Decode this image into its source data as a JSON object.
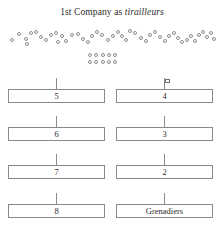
{
  "diagram": {
    "title_prefix": "1st Company as ",
    "title_emphasis": "tirailleurs",
    "background_color": "#ffffff",
    "line_color": "#8a8a8a",
    "text_color": "#2b2b2b"
  },
  "skirmish_line": {
    "name": "skirmisher-screen",
    "symbol": "open-circle",
    "count": 45,
    "circles": [
      {
        "x": 10,
        "y": 38
      },
      {
        "x": 17,
        "y": 32
      },
      {
        "x": 24,
        "y": 37
      },
      {
        "x": 29,
        "y": 31
      },
      {
        "x": 34,
        "y": 30
      },
      {
        "x": 39,
        "y": 35
      },
      {
        "x": 44,
        "y": 38
      },
      {
        "x": 49,
        "y": 33
      },
      {
        "x": 54,
        "y": 31
      },
      {
        "x": 60,
        "y": 34
      },
      {
        "x": 64,
        "y": 39
      },
      {
        "x": 70,
        "y": 33
      },
      {
        "x": 76,
        "y": 32
      },
      {
        "x": 81,
        "y": 37
      },
      {
        "x": 86,
        "y": 40
      },
      {
        "x": 90,
        "y": 34
      },
      {
        "x": 95,
        "y": 30
      },
      {
        "x": 100,
        "y": 33
      },
      {
        "x": 106,
        "y": 38
      },
      {
        "x": 111,
        "y": 34
      },
      {
        "x": 116,
        "y": 30
      },
      {
        "x": 120,
        "y": 34
      },
      {
        "x": 124,
        "y": 38
      },
      {
        "x": 128,
        "y": 29
      },
      {
        "x": 133,
        "y": 31
      },
      {
        "x": 139,
        "y": 36
      },
      {
        "x": 144,
        "y": 39
      },
      {
        "x": 148,
        "y": 33
      },
      {
        "x": 153,
        "y": 30
      },
      {
        "x": 158,
        "y": 35
      },
      {
        "x": 163,
        "y": 39
      },
      {
        "x": 167,
        "y": 34
      },
      {
        "x": 172,
        "y": 31
      },
      {
        "x": 176,
        "y": 36
      },
      {
        "x": 180,
        "y": 40
      },
      {
        "x": 185,
        "y": 38
      },
      {
        "x": 189,
        "y": 34
      },
      {
        "x": 193,
        "y": 39
      },
      {
        "x": 197,
        "y": 33
      },
      {
        "x": 201,
        "y": 30
      },
      {
        "x": 205,
        "y": 35
      },
      {
        "x": 209,
        "y": 31
      },
      {
        "x": 212,
        "y": 37
      },
      {
        "x": 56,
        "y": 40
      },
      {
        "x": 25,
        "y": 42
      }
    ]
  },
  "reserve_block": {
    "name": "skirmisher-reserve",
    "symbol": "open-circle",
    "rows": 2,
    "columns": 5,
    "count": 10,
    "circles": [
      {
        "x": 88,
        "y": 53
      },
      {
        "x": 94,
        "y": 53
      },
      {
        "x": 101,
        "y": 53
      },
      {
        "x": 107,
        "y": 53
      },
      {
        "x": 113,
        "y": 53
      },
      {
        "x": 88,
        "y": 60
      },
      {
        "x": 94,
        "y": 60
      },
      {
        "x": 101,
        "y": 60
      },
      {
        "x": 107,
        "y": 60
      },
      {
        "x": 113,
        "y": 60
      }
    ]
  },
  "formation_rows": [
    {
      "left": {
        "label": "5",
        "marker": "tick"
      },
      "right": {
        "label": "4",
        "marker": "flag"
      }
    },
    {
      "left": {
        "label": "6",
        "marker": "tick"
      },
      "right": {
        "label": "3",
        "marker": "tick"
      }
    },
    {
      "left": {
        "label": "7",
        "marker": "tick"
      },
      "right": {
        "label": "2",
        "marker": "tick"
      }
    },
    {
      "left": {
        "label": "8",
        "marker": "tick"
      },
      "right": {
        "label": "Grenadiers",
        "marker": "tick"
      }
    }
  ],
  "geometry": {
    "left_column_x": 8,
    "right_column_x": 116,
    "box_width": 97,
    "box_height": 14,
    "row_tops": [
      89,
      127,
      165,
      204
    ],
    "marker_offset_y": 11
  }
}
